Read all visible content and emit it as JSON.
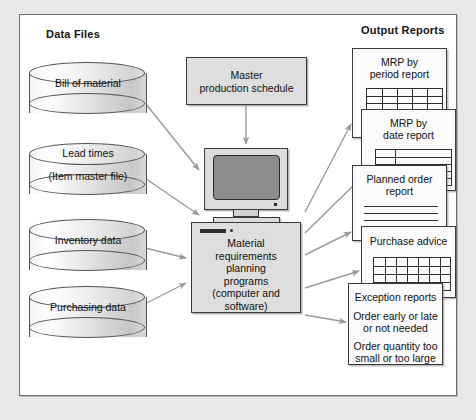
{
  "diagram": {
    "headers": {
      "left": "Data Files",
      "right": "Output Reports"
    },
    "data_files": [
      {
        "id": "bill-of-material",
        "line1": "Bill of material",
        "line2": ""
      },
      {
        "id": "lead-times",
        "line1": "Lead times",
        "line2": "(Item master file)"
      },
      {
        "id": "inventory-data",
        "line1": "Inventory data",
        "line2": ""
      },
      {
        "id": "purchasing-data",
        "line1": "Purchasing data",
        "line2": ""
      }
    ],
    "master_production_schedule": {
      "line1": "Master",
      "line2": "production schedule"
    },
    "mrp_programs": {
      "line1": "Material",
      "line2": "requirements",
      "line3": "planning",
      "line4": "programs",
      "line5": "(computer and",
      "line6": "software)"
    },
    "computer": {
      "label": "desktop-computer-monitor"
    },
    "output_reports": [
      {
        "id": "mrp-by-period-report",
        "line1": "MRP by",
        "line2": "period report",
        "pattern": "grid"
      },
      {
        "id": "mrp-by-date-report",
        "line1": "MRP by",
        "line2": "date report",
        "pattern": "grid"
      },
      {
        "id": "planned-order-report",
        "line1": "Planned order",
        "line2": "report",
        "pattern": "lines"
      },
      {
        "id": "purchase-advice-report",
        "line1": "Purchase advice",
        "line2": "",
        "pattern": "grid"
      },
      {
        "id": "exception-reports",
        "line1": "Exception reports",
        "line2": "Order early or late",
        "line3": "or not needed",
        "line4": "Order quantity too",
        "line5": "small or too large",
        "pattern": "text"
      }
    ],
    "colors": {
      "frame_border": "#6d6d6d",
      "box_fill": "#dedede",
      "box_border": "#3a3a3a",
      "screen_fill": "#8c8c8c",
      "arrow": "#9a9a9a",
      "card_fill": "#fbfbfb",
      "background": "#ffffff"
    }
  }
}
